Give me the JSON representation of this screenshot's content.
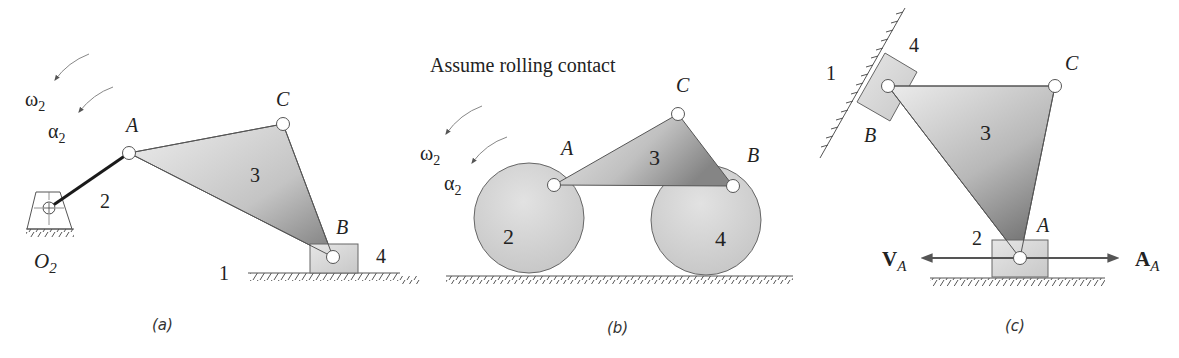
{
  "figure": {
    "panels": [
      {
        "id": "a",
        "caption": "(a)",
        "labels": {
          "omega": "ω",
          "omega_sub": "2",
          "alpha": "α",
          "alpha_sub": "2",
          "pin_A": "A",
          "pin_B": "B",
          "pin_C": "C",
          "ground_pivot": "O",
          "ground_pivot_sub": "2",
          "link_2": "2",
          "link_3": "3",
          "link_4": "4",
          "ground_1": "1"
        }
      },
      {
        "id": "b",
        "caption": "(b)",
        "note": "Assume rolling contact",
        "labels": {
          "omega": "ω",
          "omega_sub": "2",
          "alpha": "α",
          "alpha_sub": "2",
          "pin_A": "A",
          "pin_B": "B",
          "pin_C": "C",
          "wheel_2": "2",
          "link_3": "3",
          "wheel_4": "4"
        }
      },
      {
        "id": "c",
        "caption": "(c)",
        "labels": {
          "pin_A": "A",
          "pin_B": "B",
          "pin_C": "C",
          "ground_1": "1",
          "link_2": "2",
          "link_3": "3",
          "slider_4": "4",
          "velocity": "V",
          "velocity_sub": "A",
          "acceleration": "A",
          "acceleration_sub": "A"
        }
      }
    ]
  },
  "colors": {
    "line": "#555555",
    "link_dark": "#1a1a1a",
    "fill_light": "#e4e4e4",
    "fill_dark": "#8a8a8a",
    "arrow": "#666666"
  }
}
